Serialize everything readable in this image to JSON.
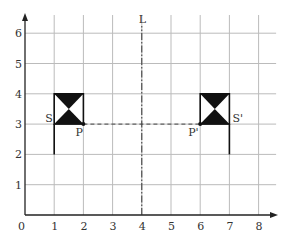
{
  "diagram": {
    "type": "coordinate-grid-reflection",
    "x_axis": {
      "ticks": [
        "0",
        "1",
        "2",
        "3",
        "4",
        "5",
        "6",
        "7",
        "8"
      ],
      "min": 0,
      "max": 8
    },
    "y_axis": {
      "ticks": [
        "1",
        "2",
        "3",
        "4",
        "5",
        "6"
      ],
      "min": 0,
      "max": 6
    },
    "mirror_line": {
      "label": "L",
      "x": 4,
      "style": "dash-dot"
    },
    "shapes": [
      {
        "name": "original",
        "label_S": "S",
        "label_P": "P",
        "S": [
          1,
          3
        ],
        "P": [
          2,
          3
        ],
        "box": [
          1,
          3,
          2,
          4
        ],
        "pole_bottom": [
          1,
          2
        ]
      },
      {
        "name": "image",
        "label_S": "S'",
        "label_P": "P'",
        "S": [
          7,
          3
        ],
        "P": [
          6,
          3
        ],
        "box": [
          6,
          3,
          7,
          4
        ],
        "pole_bottom": [
          7,
          2
        ]
      }
    ],
    "connector": {
      "from": "P",
      "to": "P'",
      "style": "dashed"
    }
  }
}
